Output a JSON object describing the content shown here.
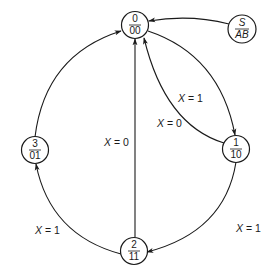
{
  "diagram": {
    "type": "state-diagram",
    "nodes": [
      {
        "id": "s0",
        "top": "0",
        "bottom": "00"
      },
      {
        "id": "s1",
        "top": "1",
        "bottom": "10"
      },
      {
        "id": "s2",
        "top": "2",
        "bottom": "11"
      },
      {
        "id": "s3",
        "top": "3",
        "bottom": "01"
      },
      {
        "id": "legend",
        "top": "S",
        "bottom": "AB"
      }
    ],
    "edges": [
      {
        "from": "legend",
        "to": "s0",
        "label": ""
      },
      {
        "from": "s0",
        "to": "s1",
        "label": "X = 1",
        "var": "X",
        "rest": " = 1"
      },
      {
        "from": "s1",
        "to": "s0",
        "label": "X = 0",
        "var": "X",
        "rest": " = 0"
      },
      {
        "from": "s1",
        "to": "s2",
        "label": "X = 1",
        "var": "X",
        "rest": " = 1"
      },
      {
        "from": "s2",
        "to": "s0",
        "label": "X = 0",
        "var": "X",
        "rest": " = 0"
      },
      {
        "from": "s2",
        "to": "s3",
        "label": "X = 1",
        "var": "X",
        "rest": " = 1"
      },
      {
        "from": "s3",
        "to": "s0",
        "label": ""
      }
    ]
  }
}
